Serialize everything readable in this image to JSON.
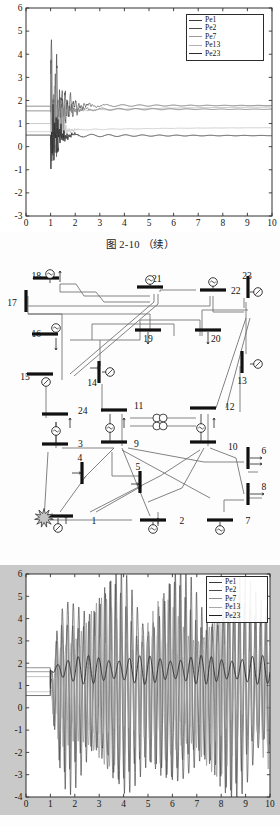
{
  "page": {
    "background": "#fdfdfd",
    "width": 280,
    "height": 826
  },
  "figure_top": {
    "caption": "图 2-10    （续）",
    "chart_data": {
      "type": "line",
      "title": "",
      "subtitle": "",
      "xlabel": "",
      "ylabel": "",
      "xlim": [
        0,
        10
      ],
      "ylim": [
        -3,
        6
      ],
      "xticks": [
        0,
        1,
        2,
        3,
        4,
        5,
        6,
        7,
        8,
        9,
        10
      ],
      "yticks": [
        -3,
        -2,
        -1,
        0,
        1,
        2,
        3,
        4,
        5,
        6
      ],
      "xtick_labels": [
        "0",
        "1",
        "2",
        "3",
        "4",
        "5",
        "6",
        "7",
        "8",
        "9",
        "10"
      ],
      "ytick_labels": [
        "-3",
        "-2",
        "-1",
        "0",
        "1",
        "2",
        "3",
        "4",
        "5",
        "6"
      ],
      "grid": false,
      "legend_position": "top-right",
      "legend_entries": [
        "Pe1",
        "Pe2",
        "Pe7",
        "Pe13",
        "Pe23"
      ],
      "description": "Damped generator electrical power oscillations after a fault at t=1 s; all traces settle by t≈4 s",
      "series": [
        {
          "name": "Pe1",
          "color": "#3a3a3a",
          "prefault_value": 1.75,
          "postfault_value": 1.78,
          "peak_max": 5.25,
          "peak_min": -2.75,
          "settles_at": 4.0
        },
        {
          "name": "Pe2",
          "color": "#4a4a4a",
          "prefault_value": 1.55,
          "postfault_value": 1.62,
          "peak_max": 3.8,
          "peak_min": -2.3,
          "settles_at": 4.0
        },
        {
          "name": "Pe7",
          "color": "#9a9a9a",
          "prefault_value": 1.0,
          "postfault_value": 1.52,
          "peak_max": 3.1,
          "peak_min": -1.6,
          "settles_at": 3.5
        },
        {
          "name": "Pe13",
          "color": "#b4b4b4",
          "prefault_value": 0.65,
          "postfault_value": 0.7,
          "peak_max": 2.2,
          "peak_min": -0.9,
          "settles_at": 3.0
        },
        {
          "name": "Pe23",
          "color": "#2a2a2a",
          "prefault_value": 0.5,
          "postfault_value": 0.48,
          "peak_max": 2.4,
          "peak_min": -1.2,
          "settles_at": 2.6
        }
      ]
    }
  },
  "figure_bottom": {
    "caption": "",
    "chart_data": {
      "type": "line",
      "title": "",
      "subtitle": "",
      "xlabel": "",
      "ylabel": "",
      "xlim": [
        0,
        10
      ],
      "ylim": [
        -4,
        6
      ],
      "xticks": [
        0,
        1,
        2,
        3,
        4,
        5,
        6,
        7,
        8,
        9,
        10
      ],
      "yticks": [
        -4,
        -3,
        -2,
        -1,
        0,
        1,
        2,
        3,
        4,
        5,
        6
      ],
      "xtick_labels": [
        "0",
        "1",
        "2",
        "3",
        "4",
        "5",
        "6",
        "7",
        "8",
        "9",
        "10"
      ],
      "ytick_labels": [
        "-4",
        "-3",
        "-2",
        "-1",
        "0",
        "1",
        "2",
        "3",
        "4",
        "5",
        "6"
      ],
      "grid": false,
      "legend_position": "top-right",
      "legend_entries": [
        "Pe1",
        "Pe2",
        "Pe7",
        "Pe13",
        "Pe23"
      ],
      "description": "Sustained undamped generator electrical power oscillations after fault at t=1 s, growing to steady limit-cycle between -4 and 6",
      "series": [
        {
          "name": "Pe1",
          "color": "#3a3a3a",
          "prefault_value": 1.8,
          "oscillation_max": 5.8,
          "oscillation_min": -3.8,
          "period": 0.22
        },
        {
          "name": "Pe2",
          "color": "#4a4a4a",
          "prefault_value": 1.62,
          "oscillation_max": 5.2,
          "oscillation_min": -3.4,
          "period": 0.22
        },
        {
          "name": "Pe7",
          "color": "#8c8c8c",
          "prefault_value": 1.4,
          "oscillation_max": 4.5,
          "oscillation_min": -2.8,
          "period": 0.21
        },
        {
          "name": "Pe13",
          "color": "#a8a8a8",
          "prefault_value": 0.72,
          "oscillation_max": 3.0,
          "oscillation_min": -1.4,
          "period": 0.21
        },
        {
          "name": "Pe23",
          "color": "#1f1f1f",
          "prefault_value": 0.55,
          "oscillation_max": 2.35,
          "oscillation_min": 1.05,
          "period": 0.42
        }
      ]
    }
  },
  "diagram": {
    "title": "",
    "type": "power-system-one-line-diagram",
    "fault_marker": {
      "label": "",
      "near_bus": "1",
      "symbol": "starburst"
    },
    "buses": [
      {
        "id": "17",
        "label": "17",
        "orientation": "vertical",
        "x": 26,
        "y": 39
      },
      {
        "id": "18",
        "label": "18",
        "orientation": "horizontal",
        "x": 46,
        "y": 16
      },
      {
        "id": "21",
        "label": "21",
        "orientation": "horizontal",
        "x": 150,
        "y": 25
      },
      {
        "id": "22",
        "label": "22",
        "orientation": "horizontal",
        "x": 213,
        "y": 28
      },
      {
        "id": "23",
        "label": "23",
        "orientation": "vertical",
        "x": 248,
        "y": 25
      },
      {
        "id": "16",
        "label": "16",
        "orientation": "horizontal",
        "x": 45,
        "y": 72
      },
      {
        "id": "19",
        "label": "19",
        "orientation": "horizontal",
        "x": 148,
        "y": 68
      },
      {
        "id": "20",
        "label": "20",
        "orientation": "horizontal",
        "x": 208,
        "y": 68
      },
      {
        "id": "15",
        "label": "15",
        "orientation": "horizontal",
        "x": 40,
        "y": 112
      },
      {
        "id": "14",
        "label": "14",
        "orientation": "vertical",
        "x": 99,
        "y": 110
      },
      {
        "id": "13",
        "label": "13",
        "orientation": "vertical",
        "x": 242,
        "y": 100
      },
      {
        "id": "24",
        "label": "24",
        "orientation": "horizontal",
        "x": 55,
        "y": 152
      },
      {
        "id": "11",
        "label": "11",
        "orientation": "horizontal",
        "x": 114,
        "y": 148
      },
      {
        "id": "12",
        "label": "12",
        "orientation": "horizontal",
        "x": 203,
        "y": 146
      },
      {
        "id": "3",
        "label": "3",
        "orientation": "horizontal",
        "x": 55,
        "y": 182
      },
      {
        "id": "9",
        "label": "9",
        "orientation": "horizontal",
        "x": 114,
        "y": 180
      },
      {
        "id": "10",
        "label": "10",
        "orientation": "horizontal",
        "x": 203,
        "y": 180
      },
      {
        "id": "6",
        "label": "6",
        "orientation": "vertical",
        "x": 248,
        "y": 196
      },
      {
        "id": "4",
        "label": "4",
        "orientation": "vertical",
        "x": 82,
        "y": 211
      },
      {
        "id": "5",
        "label": "5",
        "orientation": "vertical",
        "x": 140,
        "y": 220
      },
      {
        "id": "8",
        "label": "8",
        "orientation": "vertical",
        "x": 248,
        "y": 232
      },
      {
        "id": "1",
        "label": "1",
        "orientation": "horizontal",
        "x": 60,
        "y": 254
      },
      {
        "id": "2",
        "label": "2",
        "orientation": "horizontal",
        "x": 153,
        "y": 258
      },
      {
        "id": "7",
        "label": "7",
        "orientation": "horizontal",
        "x": 220,
        "y": 258
      }
    ],
    "generator_count": 10,
    "transformer_count": 2,
    "load_arrow_count": 9
  }
}
